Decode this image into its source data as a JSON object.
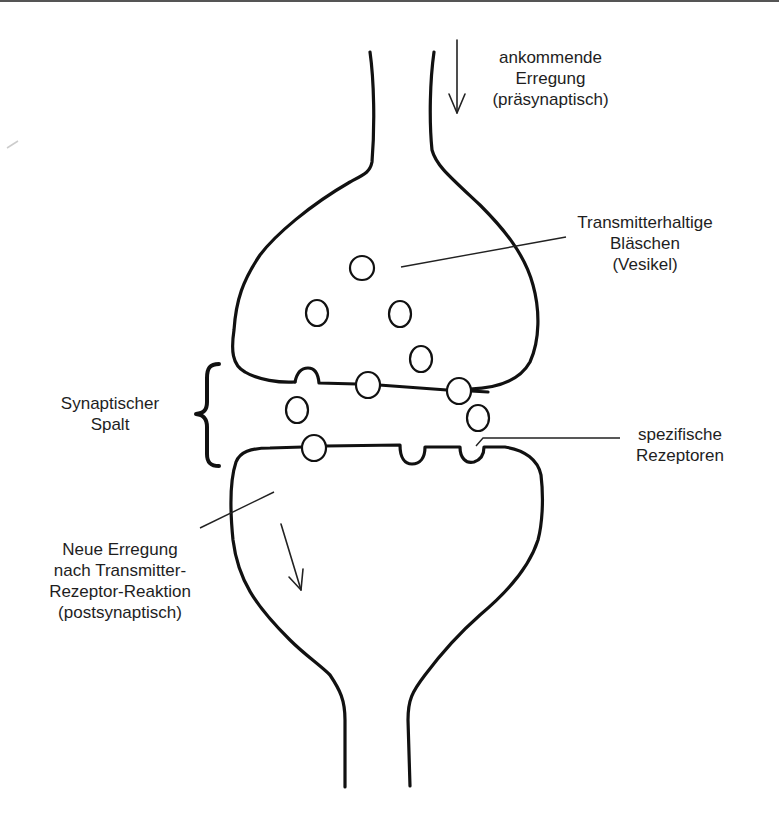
{
  "diagram": {
    "labels": {
      "incoming": [
        "ankommende",
        "Erregung",
        "(präsynaptisch)"
      ],
      "vesicles": [
        "Transmitterhaltige",
        "Bläschen",
        "(Vesikel)"
      ],
      "cleft": [
        "Synaptischer",
        "Spalt"
      ],
      "receptors": [
        "spezifische",
        "Rezeptoren"
      ],
      "new_excitation": [
        "Neue Erregung",
        "nach Transmitter-",
        "Rezeptor-Reaktion",
        "(postsynaptisch)"
      ]
    },
    "icons": {
      "incoming_arrow": "arrow-down-icon",
      "outgoing_arrow": "arrow-down-right-icon",
      "cleft_brace": "curly-brace-icon"
    },
    "colors": {
      "stroke": "#111111",
      "text": "#1e1e1e",
      "background": "#ffffff"
    }
  }
}
